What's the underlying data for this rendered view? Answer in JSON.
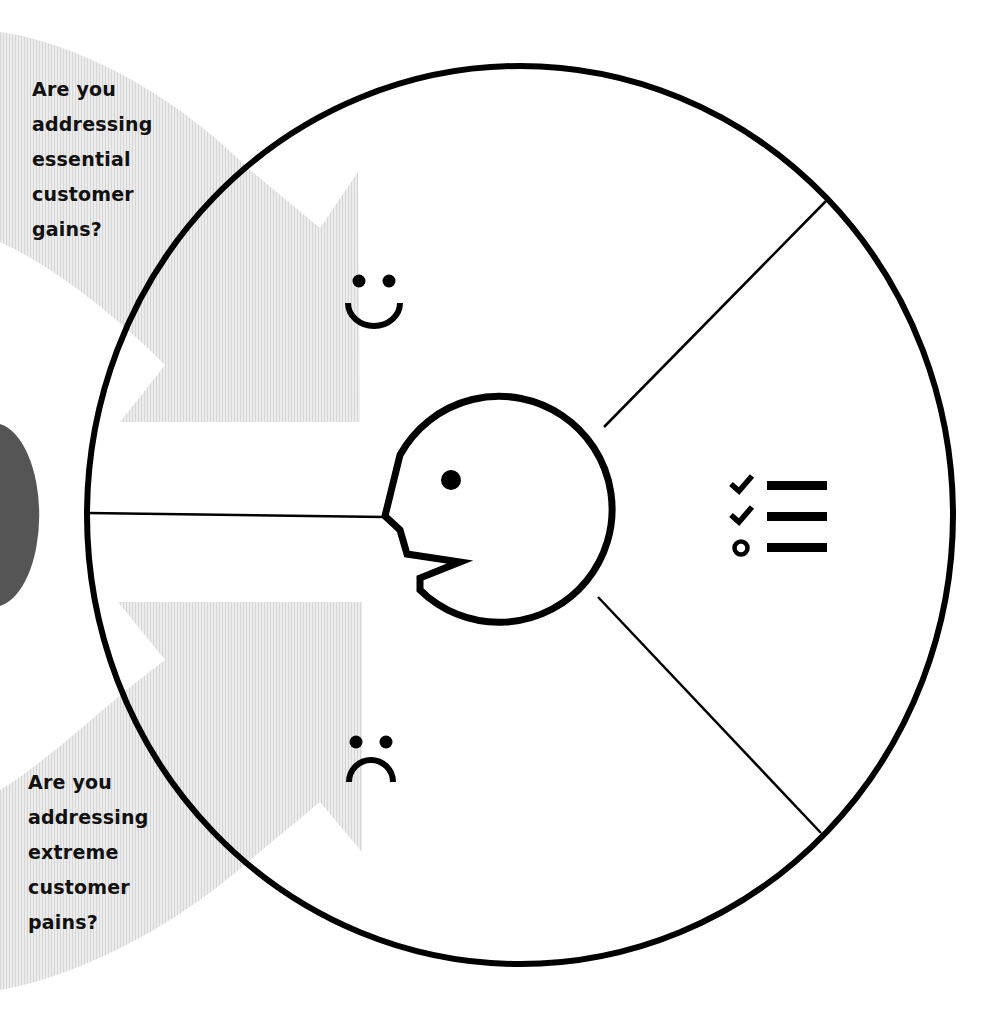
{
  "diagram": {
    "segments": [
      {
        "id": "gains",
        "icon": "smiley-face-icon",
        "label": "Gains"
      },
      {
        "id": "jobs",
        "icon": "checklist-icon",
        "label": "Customer Jobs"
      },
      {
        "id": "pains",
        "icon": "frowning-face-icon",
        "label": "Pains"
      }
    ],
    "center_icon": "customer-head-profile-icon"
  },
  "questions": {
    "gains": {
      "lines": [
        "Are you",
        "addressing",
        "essential",
        "customer",
        "gains?"
      ]
    },
    "pains": {
      "lines": [
        "Are you",
        "addressing",
        "extreme",
        "customer",
        "pains?"
      ]
    }
  },
  "colors": {
    "stroke": "#000000",
    "arrow_fill": "#e4e4e4",
    "semicircle_fill": "#555555",
    "background": "#ffffff",
    "text": "#111111"
  }
}
